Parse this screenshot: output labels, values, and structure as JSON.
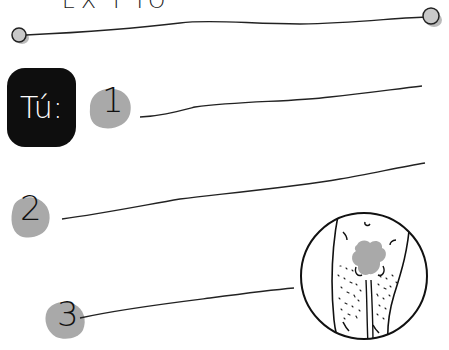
{
  "header": {
    "title_partial": "EX I IO",
    "line_endpoints": "circle-markers"
  },
  "badge": {
    "label": "Tú:"
  },
  "answer_items": [
    {
      "number": "1"
    },
    {
      "number": "2"
    },
    {
      "number": "3"
    }
  ],
  "illustration": {
    "name": "circular-detail-drawing"
  },
  "colors": {
    "ink": "#111111",
    "badge_bg": "#0e0e0e",
    "badge_text": "#ffffff",
    "dot_gray": "#a9a9a9",
    "background": "#ffffff"
  }
}
